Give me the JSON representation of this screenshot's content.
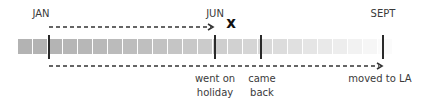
{
  "diagram": {
    "type": "timeline",
    "top_labels": [
      {
        "text": "JAN",
        "x": 41
      },
      {
        "text": "JUN",
        "x": 215
      },
      {
        "text": "SEPT",
        "x": 383
      }
    ],
    "bottom_labels": [
      {
        "line1": "went on",
        "line2": "holiday",
        "x": 215
      },
      {
        "line1": "came",
        "line2": "back",
        "x": 261
      },
      {
        "line1": "moved to LA",
        "line2": "",
        "x": 380
      }
    ],
    "markers": [
      {
        "name": "jan",
        "x": 49
      },
      {
        "name": "jun-went-on-holiday",
        "x": 215
      },
      {
        "name": "came-back",
        "x": 261
      },
      {
        "name": "sept-moved-to-la",
        "x": 383
      }
    ],
    "x_mark": {
      "text": "x",
      "x": 231
    },
    "top_arrow": {
      "from_x": 49,
      "to_x": 214,
      "y": 27
    },
    "bottom_arrow": {
      "from_x": 49,
      "to_x": 382,
      "y": 66
    },
    "bar": {
      "segment_count": 25,
      "start_color": "#b3b3b3",
      "end_color": "#fbfbfb"
    },
    "colors": {
      "marker": "#2a2a2a",
      "arrow": "#333333",
      "text": "#3a3a3a"
    }
  }
}
